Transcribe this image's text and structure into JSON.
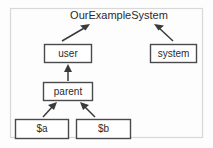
{
  "diagram": {
    "title": "OurExampleSystem",
    "frame": {
      "x": 10,
      "y": 8,
      "width": 193,
      "height": 130
    },
    "title_pos": {
      "x": 119,
      "y": 16
    },
    "nodes": [
      {
        "id": "user",
        "label": "user",
        "x": 44,
        "y": 44,
        "width": 48,
        "height": 19
      },
      {
        "id": "system",
        "label": "system",
        "x": 150,
        "y": 44,
        "width": 47,
        "height": 19
      },
      {
        "id": "parent",
        "label": "parent",
        "x": 43,
        "y": 82,
        "width": 50,
        "height": 19
      },
      {
        "id": "a",
        "label": "$a",
        "x": 15,
        "y": 119,
        "width": 54,
        "height": 20
      },
      {
        "id": "b",
        "label": "$b",
        "x": 76,
        "y": 119,
        "width": 55,
        "height": 20
      }
    ],
    "edges": [
      {
        "id": "user-to-title",
        "from": "user",
        "to": "OurExampleSystem",
        "x1": 62,
        "y1": 41,
        "x2": 89,
        "y2": 25
      },
      {
        "id": "system-to-title",
        "from": "system",
        "to": "OurExampleSystem",
        "x1": 173,
        "y1": 41,
        "x2": 155,
        "y2": 25
      },
      {
        "id": "parent-to-user",
        "from": "parent",
        "to": "user",
        "x1": 68,
        "y1": 80,
        "x2": 68,
        "y2": 65
      },
      {
        "id": "a-to-parent",
        "from": "$a",
        "to": "parent",
        "x1": 43,
        "y1": 117,
        "x2": 56,
        "y2": 103
      },
      {
        "id": "b-to-parent",
        "from": "$b",
        "to": "parent",
        "x1": 95,
        "y1": 117,
        "x2": 81,
        "y2": 103
      }
    ],
    "colors": {
      "node_stroke": "#4a4a4a",
      "node_fill": "#ffffff",
      "edge": "#3a3a3a",
      "text": "#2b2b2b",
      "frame": "#d8d8d8",
      "background": "#fdfdfd"
    }
  }
}
